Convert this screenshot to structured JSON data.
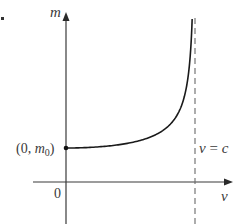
{
  "chart_data": {
    "type": "line",
    "title": "",
    "xlabel": "v",
    "ylabel": "m",
    "x_axis": {
      "label": "v",
      "origin_label": "0",
      "pixel": {
        "y": 182,
        "x_start": 33,
        "x_end": 232,
        "origin_x": 66
      }
    },
    "y_axis": {
      "label": "m",
      "pixel": {
        "x": 66,
        "y_start": 224,
        "y_end": 12
      }
    },
    "series": [
      {
        "name": "relativistic mass",
        "equation": "m = m0 / sqrt(1 - v^2/c^2)",
        "x_over_c": [
          0,
          0.2,
          0.4,
          0.6,
          0.7,
          0.8,
          0.85,
          0.9,
          0.93,
          0.95,
          0.96,
          0.97,
          0.978
        ],
        "m_over_m0": [
          1.0,
          1.021,
          1.091,
          1.25,
          1.4,
          1.667,
          1.898,
          2.294,
          2.721,
          3.203,
          3.571,
          4.113,
          4.79
        ]
      }
    ],
    "annotations": [
      {
        "text": "(0, m₀)",
        "at": {
          "v": 0,
          "m": "m0"
        },
        "marker": "dot"
      },
      {
        "text": "v = c",
        "type": "vertical-asymptote",
        "style": "dashed",
        "x": "c"
      }
    ],
    "scale": {
      "c_px": 129,
      "m0_px": 34
    },
    "grid": false,
    "legend": null
  },
  "labels": {
    "y_axis": "m",
    "x_axis": "v",
    "origin": "0",
    "point_prefix": "(0, ",
    "point_m": "m",
    "point_sub": "0",
    "point_suffix": ")",
    "asymptote_v": "v",
    "asymptote_eq": " = ",
    "asymptote_c": "c"
  },
  "colors": {
    "axis": "#3a3a3a",
    "curve": "#1a1a1a",
    "asymptote": "#6a6a6a",
    "text": "#3a3a3a",
    "background": "#ffffff"
  }
}
